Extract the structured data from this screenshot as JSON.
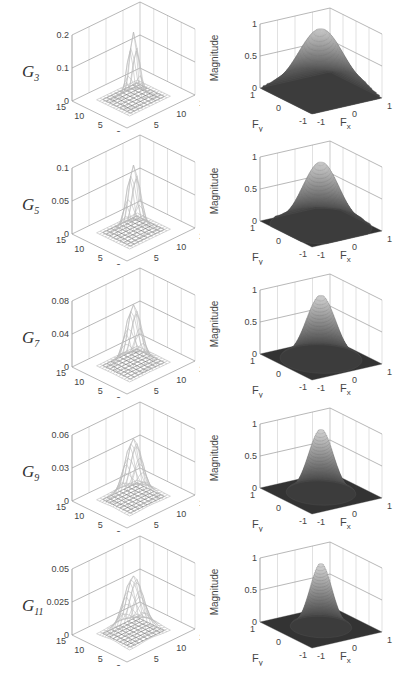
{
  "figure": {
    "rows": [
      {
        "label": "G",
        "sub": "3",
        "spatial": {
          "zticks": [
            "0.2",
            "0.1",
            "0"
          ],
          "peak_rel": 1.0,
          "width": 1.2
        },
        "freq": {
          "zlabel": "Magnitude",
          "zticks": [
            "1",
            "0.5",
            "0"
          ],
          "width": 0.62
        }
      },
      {
        "label": "G",
        "sub": "5",
        "spatial": {
          "zticks": [
            "0.1",
            "0.05",
            "0"
          ],
          "peak_rel": 1.0,
          "width": 1.7
        },
        "freq": {
          "zlabel": "Magnitude",
          "zticks": [
            "1",
            "0.5",
            "0"
          ],
          "width": 0.5
        }
      },
      {
        "label": "G",
        "sub": "7",
        "spatial": {
          "zticks": [
            "0.08",
            "0.04",
            "0"
          ],
          "peak_rel": 0.9,
          "width": 2.2
        },
        "freq": {
          "zlabel": "Magnitude",
          "zticks": [
            "1",
            "0.5",
            "0"
          ],
          "width": 0.4
        }
      },
      {
        "label": "G",
        "sub": "9",
        "spatial": {
          "zticks": [
            "0.06",
            "0.03",
            "0"
          ],
          "peak_rel": 0.9,
          "width": 2.6
        },
        "freq": {
          "zlabel": "Magnitude",
          "zticks": [
            "1",
            "0.5",
            "0"
          ],
          "width": 0.34
        }
      },
      {
        "label": "G",
        "sub": "11",
        "spatial": {
          "zticks": [
            "0.05",
            "0.025",
            "0"
          ],
          "peak_rel": 0.85,
          "width": 3.0
        },
        "freq": {
          "zlabel": "Magnitude",
          "zticks": [
            "1",
            "0.5",
            "0"
          ],
          "width": 0.3
        }
      }
    ],
    "spatial_axes": {
      "x_ticks": [
        "0",
        "5",
        "10",
        "15"
      ],
      "y_ticks": [
        "0",
        "5",
        "10",
        "15"
      ]
    },
    "freq_axes": {
      "x_label": "F",
      "x_sub": "x",
      "y_label": "F",
      "y_sub": "y",
      "x_ticks": [
        "-1",
        "0",
        "1"
      ],
      "y_ticks": [
        "-1",
        "0",
        "1"
      ]
    },
    "colors": {
      "axis": "#999999",
      "grid": "#cccccc",
      "surface_light": "#ffffff",
      "surface_dark": "#222222"
    }
  },
  "chart_data": [
    {
      "type": "surface",
      "title": "G3 spatial kernel",
      "zlim": [
        0,
        0.2
      ],
      "xlim": [
        0,
        15
      ],
      "ylim": [
        0,
        15
      ],
      "zticks": [
        0,
        0.1,
        0.2
      ]
    },
    {
      "type": "surface",
      "title": "G3 frequency response",
      "zlabel": "Magnitude",
      "xlabel": "Fx",
      "ylabel": "Fy",
      "zlim": [
        0,
        1
      ],
      "xlim": [
        -1,
        1
      ],
      "ylim": [
        -1,
        1
      ]
    },
    {
      "type": "surface",
      "title": "G5 spatial kernel",
      "zlim": [
        0,
        0.1
      ],
      "xlim": [
        0,
        15
      ],
      "ylim": [
        0,
        15
      ],
      "zticks": [
        0,
        0.05,
        0.1
      ]
    },
    {
      "type": "surface",
      "title": "G5 frequency response",
      "zlabel": "Magnitude",
      "xlabel": "Fx",
      "ylabel": "Fy",
      "zlim": [
        0,
        1
      ],
      "xlim": [
        -1,
        1
      ],
      "ylim": [
        -1,
        1
      ]
    },
    {
      "type": "surface",
      "title": "G7 spatial kernel",
      "zlim": [
        0,
        0.08
      ],
      "xlim": [
        0,
        15
      ],
      "ylim": [
        0,
        15
      ],
      "zticks": [
        0,
        0.04,
        0.08
      ]
    },
    {
      "type": "surface",
      "title": "G7 frequency response",
      "zlabel": "Magnitude",
      "xlabel": "Fx",
      "ylabel": "Fy",
      "zlim": [
        0,
        1
      ],
      "xlim": [
        -1,
        1
      ],
      "ylim": [
        -1,
        1
      ]
    },
    {
      "type": "surface",
      "title": "G9 spatial kernel",
      "zlim": [
        0,
        0.06
      ],
      "xlim": [
        0,
        15
      ],
      "ylim": [
        0,
        15
      ],
      "zticks": [
        0,
        0.03,
        0.06
      ]
    },
    {
      "type": "surface",
      "title": "G9 frequency response",
      "zlabel": "Magnitude",
      "xlabel": "Fx",
      "ylabel": "Fy",
      "zlim": [
        0,
        1
      ],
      "xlim": [
        -1,
        1
      ],
      "ylim": [
        -1,
        1
      ]
    },
    {
      "type": "surface",
      "title": "G11 spatial kernel",
      "zlim": [
        0,
        0.05
      ],
      "xlim": [
        0,
        15
      ],
      "ylim": [
        0,
        15
      ],
      "zticks": [
        0,
        0.025,
        0.05
      ]
    },
    {
      "type": "surface",
      "title": "G11 frequency response",
      "zlabel": "Magnitude",
      "xlabel": "Fx",
      "ylabel": "Fy",
      "zlim": [
        0,
        1
      ],
      "xlim": [
        -1,
        1
      ],
      "ylim": [
        -1,
        1
      ]
    }
  ]
}
